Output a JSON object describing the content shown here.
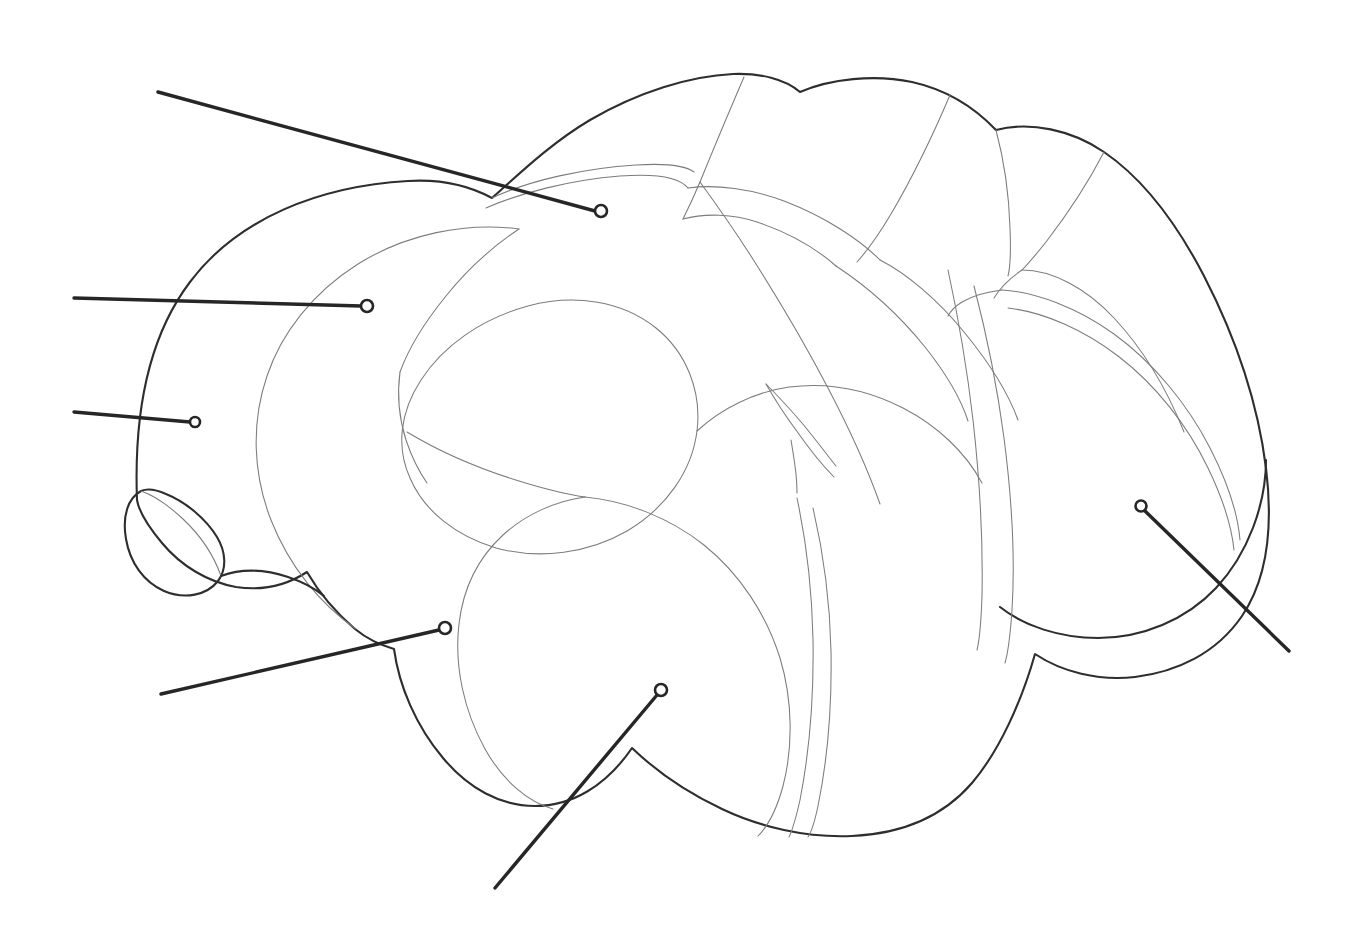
{
  "figure": {
    "kind": "line-art anatomical diagram",
    "background_color": "#ffffff",
    "canvas": {
      "width": 1353,
      "height": 942
    },
    "style": {
      "outline_color": "#2e2e2e",
      "outline_width": 2.1,
      "inner_line_color": "#7c7c7c",
      "inner_line_width": 1.05,
      "leader_color": "#262626",
      "leader_width": 3.4,
      "marker_fill": "#ffffff",
      "marker_radius": 6
    }
  },
  "callouts": [
    {
      "id": "callout-1",
      "name": "callout-upper-left-long",
      "label": "",
      "marker": {
        "x": 601,
        "y": 211,
        "r": 6
      },
      "line": {
        "x1": 158,
        "y1": 92,
        "x2": 595,
        "y2": 211
      }
    },
    {
      "id": "callout-2",
      "name": "callout-left-upper",
      "label": "",
      "marker": {
        "x": 367,
        "y": 306,
        "r": 6
      },
      "line": {
        "x1": 74,
        "y1": 298,
        "x2": 361,
        "y2": 306
      }
    },
    {
      "id": "callout-3",
      "name": "callout-left-middle",
      "label": "",
      "marker": {
        "x": 195,
        "y": 422,
        "r": 5
      },
      "line": {
        "x1": 74,
        "y1": 412,
        "x2": 190,
        "y2": 422
      }
    },
    {
      "id": "callout-4",
      "name": "callout-lower-left",
      "label": "",
      "marker": {
        "x": 445,
        "y": 628,
        "r": 6
      },
      "line": {
        "x1": 161,
        "y1": 694,
        "x2": 439,
        "y2": 630
      }
    },
    {
      "id": "callout-5",
      "name": "callout-bottom-center",
      "label": "",
      "marker": {
        "x": 661,
        "y": 690,
        "r": 6
      },
      "line": {
        "x1": 495,
        "y1": 888,
        "x2": 657,
        "y2": 695
      }
    },
    {
      "id": "callout-6",
      "name": "callout-right",
      "label": "",
      "marker": {
        "x": 1141,
        "y": 506,
        "r": 5.5
      },
      "line": {
        "x1": 1289,
        "y1": 651,
        "x2": 1145,
        "y2": 511
      }
    }
  ],
  "regions": [
    {
      "id": "region-dorsal-lobe-1",
      "name": "dorsal-lobe-anterior"
    },
    {
      "id": "region-dorsal-lobe-2",
      "name": "dorsal-lobe-middle"
    },
    {
      "id": "region-dorsal-lobe-3",
      "name": "dorsal-lobe-posterior"
    },
    {
      "id": "region-dorsal-lobe-4",
      "name": "dorsal-lobe-caudal"
    },
    {
      "id": "region-anterior-cap",
      "name": "anterior-cap"
    },
    {
      "id": "region-central-ellipse",
      "name": "central-ellipsoid-body"
    },
    {
      "id": "region-lower-lobe",
      "name": "ventral-lobe"
    },
    {
      "id": "region-small-protrusion",
      "name": "anterior-protrusion"
    },
    {
      "id": "region-posterior-mass",
      "name": "posterior-mass"
    },
    {
      "id": "region-oblique-band",
      "name": "oblique-commissural-band"
    }
  ]
}
